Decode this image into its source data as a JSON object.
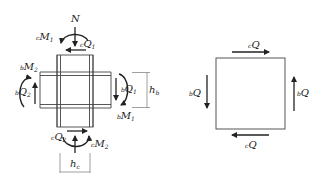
{
  "joint": {
    "axial_force": {
      "label": "N"
    },
    "column_moment_top": {
      "pre": "c",
      "label": "M",
      "sub": "1"
    },
    "column_shear_top": {
      "pre": "c",
      "label": "Q",
      "sub": "1"
    },
    "beam_moment_left": {
      "pre": "b",
      "label": "M",
      "sub": "2"
    },
    "beam_shear_left": {
      "pre": "b",
      "label": "Q",
      "sub": "2"
    },
    "beam_shear_right": {
      "pre": "b",
      "label": "Q",
      "sub": "1"
    },
    "beam_moment_right": {
      "pre": "b",
      "label": "M",
      "sub": "1"
    },
    "column_shear_bottom": {
      "pre": "c",
      "label": "Q",
      "sub": "2"
    },
    "column_moment_bottom": {
      "pre": "c",
      "label": "M",
      "sub": "2"
    },
    "beam_depth": {
      "label": "h",
      "sub": "b"
    },
    "column_depth": {
      "label": "h",
      "sub": "c"
    }
  },
  "panel": {
    "top_shear": {
      "pre": "c",
      "label": "Q"
    },
    "bottom_shear": {
      "pre": "c",
      "label": "Q"
    },
    "left_shear": {
      "pre": "b",
      "label": "Q"
    },
    "right_shear": {
      "pre": "b",
      "label": "Q"
    }
  },
  "colors": {
    "line": "#333333",
    "member_fill": "#eeeeee"
  }
}
